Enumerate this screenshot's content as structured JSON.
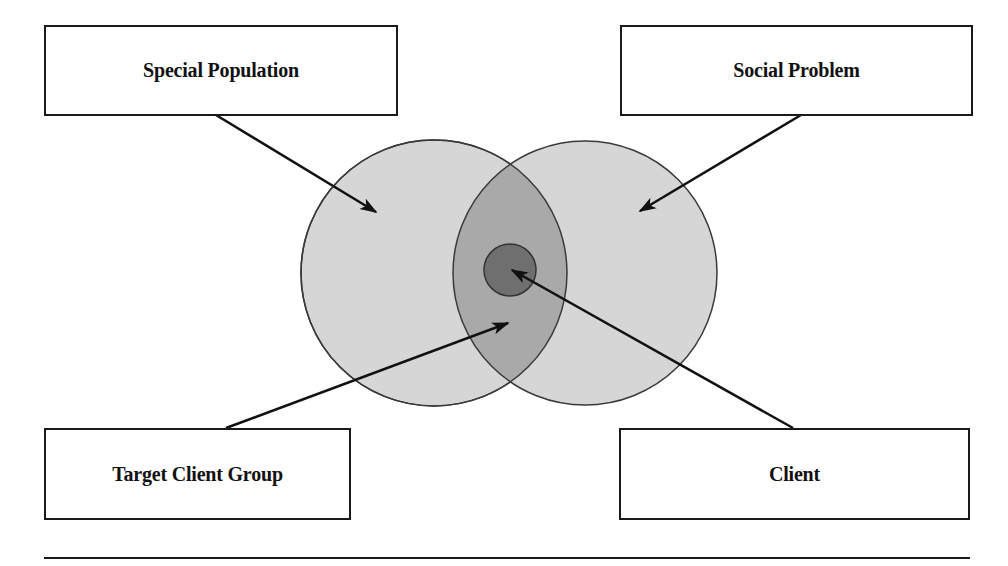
{
  "diagram": {
    "type": "venn-with-callouts",
    "labels": {
      "special_population": "Special Population",
      "social_problem": "Social Problem",
      "target_client_group": "Target Client Group",
      "client": "Client"
    },
    "colors": {
      "outer_circle_fill": "#d6d6d6",
      "overlap_fill": "#a9a9a9",
      "core_fill": "#6f6f6f",
      "stroke": "#3a3a3a",
      "arrow": "#111111"
    },
    "sets": [
      {
        "id": "special_population",
        "cx": 434,
        "cy": 273,
        "r": 133
      },
      {
        "id": "social_problem",
        "cx": 585,
        "cy": 273,
        "r": 132
      }
    ],
    "intersection_label": "target_client_group",
    "core": {
      "id": "client",
      "cx": 510,
      "cy": 270,
      "r": 26
    },
    "arrows": [
      {
        "from": "special_population",
        "x1": 216,
        "y1": 115,
        "x2": 376,
        "y2": 212
      },
      {
        "from": "social_problem",
        "x1": 801,
        "y1": 115,
        "x2": 640,
        "y2": 211
      },
      {
        "from": "target_client_group",
        "x1": 226,
        "y1": 428,
        "x2": 508,
        "y2": 323
      },
      {
        "from": "client",
        "x1": 793,
        "y1": 428,
        "x2": 512,
        "y2": 270
      }
    ]
  }
}
